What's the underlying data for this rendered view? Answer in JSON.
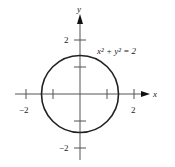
{
  "figure": {
    "equation_label": "x² + y² = 2",
    "x_axis_label": "x",
    "y_axis_label": "y",
    "x_ticks": [
      {
        "value": -2,
        "label": "−2"
      },
      {
        "value": -1,
        "label": ""
      },
      {
        "value": 1,
        "label": ""
      },
      {
        "value": 2,
        "label": "2"
      }
    ],
    "y_ticks": [
      {
        "value": 2,
        "label": "2"
      },
      {
        "value": 1,
        "label": ""
      },
      {
        "value": -1,
        "label": ""
      },
      {
        "value": -2,
        "label": "−2"
      }
    ],
    "curve": {
      "type": "circle",
      "center": [
        0,
        0
      ],
      "radius_squared": 2
    },
    "colors": {
      "axis": "#555555",
      "curve": "#222222"
    }
  }
}
